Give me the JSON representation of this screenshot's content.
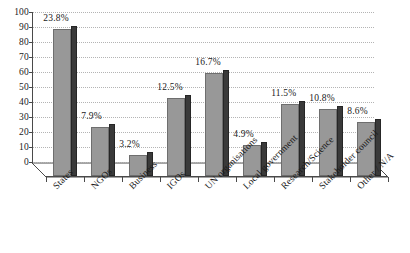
{
  "chart_data": {
    "type": "bar",
    "title": "",
    "subtitle": "",
    "xlabel": "",
    "ylabel": "",
    "ylim": [
      0,
      100
    ],
    "ytick_step": 10,
    "yticks": [
      "0",
      "10",
      "20",
      "30",
      "40",
      "50",
      "60",
      "70",
      "80",
      "90",
      "100"
    ],
    "grid": true,
    "grid_style": "dotted-horizontal",
    "legend": "none",
    "style": "3d-bar",
    "categories": [
      "States",
      "NGOs",
      "Business",
      "IGOs",
      "UN organisations",
      "Local government",
      "Research/Science",
      "Stakeholder council",
      "Other / N/A"
    ],
    "values": [
      98,
      33,
      14,
      52,
      69,
      21,
      48,
      45,
      36
    ],
    "data_labels": [
      "23.8%",
      "7.9%",
      "3.2%",
      "12.5%",
      "16.7%",
      "4.9%",
      "11.5%",
      "10.8%",
      "8.6%"
    ]
  },
  "colors": {
    "bar_face": "#989898",
    "bar_side": "#3a3a3a",
    "bar_outline": "#6e6e6e",
    "axis": "#4a4a4a",
    "gridline": "#b4b4b4",
    "text": "#1a1a1a",
    "background": "#ffffff"
  }
}
